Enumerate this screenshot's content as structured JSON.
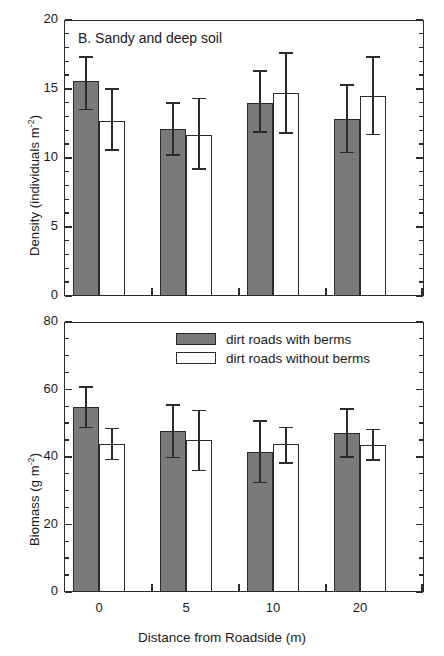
{
  "figure": {
    "xaxis_title": "Distance from Roadside (m)",
    "categories": [
      "0",
      "5",
      "10",
      "20"
    ]
  },
  "legend": {
    "items": [
      {
        "label": "dirt roads with berms",
        "style": "filled",
        "color": "#7a7a7a"
      },
      {
        "label": "dirt roads without berms",
        "style": "open",
        "color": "#ffffff"
      }
    ]
  },
  "panel_top": {
    "title": "B.  Sandy and deep soil",
    "ylabel_main": "Density (individuals m",
    "ylabel_sup": "-2",
    "ylabel_close": ")",
    "yticks": [
      "0",
      "5",
      "10",
      "15",
      "20"
    ]
  },
  "panel_bottom": {
    "ylabel_main": "Biomass (g m",
    "ylabel_sup": "-2",
    "ylabel_close": ")",
    "yticks": [
      "0",
      "20",
      "40",
      "60",
      "80"
    ]
  },
  "chart_data": [
    {
      "type": "bar",
      "panel": "B",
      "title": "B.  Sandy and deep soil",
      "xlabel": "Distance from Roadside (m)",
      "ylabel": "Density (individuals m-2)",
      "categories": [
        "0",
        "5",
        "10",
        "20"
      ],
      "ylim": [
        0,
        20
      ],
      "ytick_step": 5,
      "yminor_step": 1,
      "grid": false,
      "legend_position": "none",
      "series": [
        {
          "name": "dirt roads with berms",
          "style": "filled",
          "values": [
            15.6,
            12.1,
            14.0,
            12.8
          ],
          "err_low": [
            13.5,
            10.2,
            11.9,
            10.4
          ],
          "err_high": [
            17.3,
            14.0,
            16.3,
            15.3
          ]
        },
        {
          "name": "dirt roads without berms",
          "style": "open",
          "values": [
            12.7,
            11.7,
            14.7,
            14.5
          ],
          "err_low": [
            10.6,
            9.2,
            11.8,
            11.7
          ],
          "err_high": [
            15.0,
            14.3,
            17.6,
            17.3
          ]
        }
      ]
    },
    {
      "type": "bar",
      "panel": "C",
      "title": "",
      "xlabel": "Distance from Roadside (m)",
      "ylabel": "Biomass (g m-2)",
      "categories": [
        "0",
        "5",
        "10",
        "20"
      ],
      "ylim": [
        0,
        80
      ],
      "ytick_step": 20,
      "yminor_step": 5,
      "grid": false,
      "legend_position": "top-center",
      "series": [
        {
          "name": "dirt roads with berms",
          "style": "filled",
          "values": [
            54.8,
            47.7,
            41.6,
            47.2
          ],
          "err_low": [
            48.7,
            39.9,
            32.5,
            40.0
          ],
          "err_high": [
            60.8,
            55.4,
            50.6,
            54.3
          ]
        },
        {
          "name": "dirt roads without berms",
          "style": "open",
          "values": [
            43.8,
            44.9,
            44.0,
            43.6
          ],
          "err_low": [
            39.2,
            36.0,
            38.3,
            39.1
          ],
          "err_high": [
            48.4,
            53.8,
            48.8,
            48.2
          ]
        }
      ]
    }
  ]
}
